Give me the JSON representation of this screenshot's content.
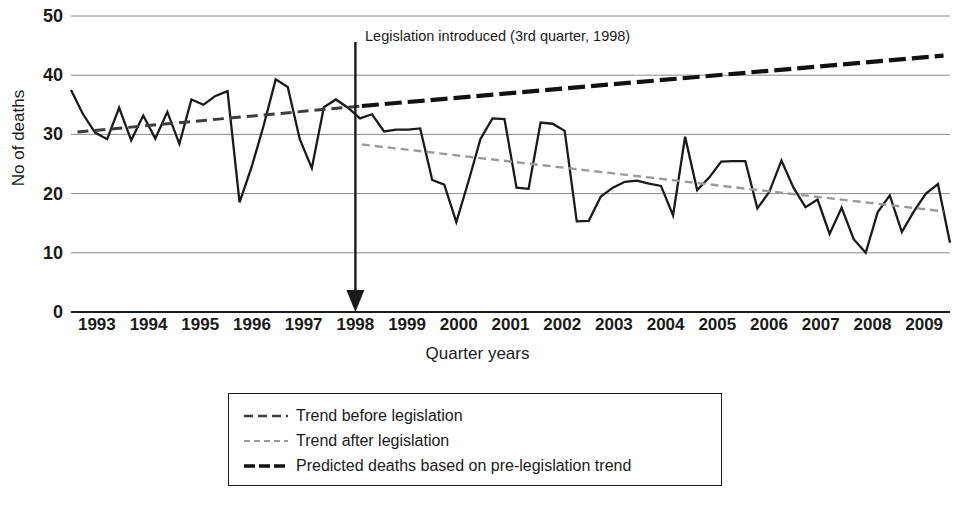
{
  "chart_data": {
    "type": "line",
    "title": "",
    "xlabel": "Quarter years",
    "ylabel": "No of deaths",
    "ylim": [
      0,
      50
    ],
    "yticks": [
      0,
      10,
      20,
      30,
      40,
      50
    ],
    "grid": true,
    "legend_position": "below-plot",
    "xtick_labels": [
      "1993",
      "1994",
      "1995",
      "1996",
      "1997",
      "1998",
      "1999",
      "2000",
      "2001",
      "2002",
      "2003",
      "2004",
      "2005",
      "2006",
      "2007",
      "2008",
      "2009"
    ],
    "x_note": "Quarterly observations, 4 per year, 1993 Q1 through 2009 Q4",
    "annotations": [
      {
        "text": "Legislation introduced (3rd quarter, 1998)",
        "marker": "downward-arrow at 1998 Q3",
        "x_value": "1998.5"
      }
    ],
    "series": [
      {
        "name": "Observed deaths",
        "style": "solid",
        "color": "#1a1a1a",
        "values": [
          37.5,
          33.4,
          30.3,
          29.2,
          34.5,
          29.0,
          33.2,
          29.3,
          33.8,
          28.4,
          35.9,
          35.0,
          36.5,
          37.3,
          18.5,
          24.5,
          31.5,
          39.3,
          38.0,
          29.2,
          24.3,
          34.6,
          35.9,
          34.5,
          32.7,
          33.4,
          30.5,
          30.8,
          30.8,
          31.0,
          22.3,
          21.5,
          15.2,
          22.0,
          29.2,
          32.7,
          32.6,
          21.0,
          20.8,
          32.0,
          31.8,
          30.6,
          15.3,
          15.4,
          19.5,
          21.0,
          22.0,
          22.2,
          21.7,
          21.3,
          16.3,
          29.6,
          20.6,
          22.7,
          25.4,
          25.5,
          25.5,
          17.5,
          20.3,
          25.6,
          21.0,
          17.7,
          19.0,
          13.2,
          17.6,
          12.3,
          10.0,
          16.9,
          19.7,
          13.5,
          17.0,
          20.0,
          21.6,
          11.7
        ]
      },
      {
        "name": "Trend before legislation",
        "style": "dashed",
        "color": "#3c3c3c",
        "from": {
          "x": "1993 Q1",
          "y": 30.4
        },
        "to": {
          "x": "1998 Q3",
          "y": 34.8
        }
      },
      {
        "name": "Trend after legislation",
        "style": "dotted-light",
        "color": "#9a9a9a",
        "from": {
          "x": "1998 Q3",
          "y": 28.3
        },
        "to": {
          "x": "2009 Q4",
          "y": 17.0
        }
      },
      {
        "name": "Predicted deaths based on pre-legislation trend",
        "style": "dash-dot-heavy",
        "color": "#111111",
        "from": {
          "x": "1998 Q3",
          "y": 34.8
        },
        "to": {
          "x": "2009 Q4",
          "y": 43.3
        }
      }
    ]
  },
  "axis": {
    "y_title": "No of deaths",
    "x_title": "Quarter years"
  },
  "annotation": {
    "legislation_note": "Legislation introduced (3rd quarter, 1998)"
  },
  "legend": {
    "items": [
      {
        "label": "Trend before legislation",
        "swatch": "dashed-line-swatch"
      },
      {
        "label": "Trend after legislation",
        "swatch": "dotted-line-swatch"
      },
      {
        "label": "Predicted deaths based on pre-legislation trend",
        "swatch": "dash-dot-line-swatch"
      }
    ]
  }
}
